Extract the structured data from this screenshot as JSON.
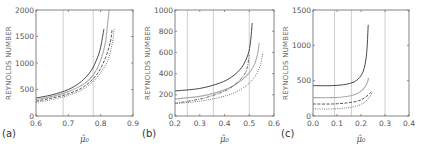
{
  "chart_data": [
    {
      "panel": "(a)",
      "type": "line",
      "xlabel": "μ̂₀",
      "ylabel": "REYNOLDS NUMBER",
      "xlim": [
        0.6,
        0.9
      ],
      "ylim": [
        0,
        2000
      ],
      "xticks": [
        "0.6",
        "0.7",
        "0.8",
        "0.9"
      ],
      "yticks": [
        "0",
        "500",
        "1000",
        "1500",
        "2000"
      ],
      "grid": false,
      "vlines": [
        0.684,
        0.777
      ],
      "series": [
        {
          "name": "solid",
          "style": "solid",
          "color": "#333333",
          "x": [
            0.6,
            0.65,
            0.7,
            0.74,
            0.77,
            0.79,
            0.8,
            0.81
          ],
          "y": [
            340,
            400,
            500,
            650,
            850,
            1100,
            1300,
            1640
          ]
        },
        {
          "name": "gray",
          "style": "solid",
          "color": "#aaaaaa",
          "x": [
            0.6,
            0.65,
            0.7,
            0.75,
            0.78,
            0.8,
            0.815,
            0.826
          ],
          "y": [
            310,
            370,
            460,
            610,
            800,
            1050,
            1400,
            2000
          ]
        },
        {
          "name": "dashed",
          "style": "dashed",
          "color": "#444444",
          "x": [
            0.6,
            0.65,
            0.7,
            0.75,
            0.79,
            0.815,
            0.83,
            0.835
          ],
          "y": [
            280,
            340,
            420,
            560,
            800,
            1100,
            1400,
            1620
          ]
        },
        {
          "name": "dotted",
          "style": "dotted",
          "color": "#666666",
          "x": [
            0.6,
            0.65,
            0.7,
            0.75,
            0.79,
            0.82,
            0.835,
            0.842
          ],
          "y": [
            255,
            310,
            390,
            520,
            740,
            1020,
            1350,
            1650
          ]
        }
      ]
    },
    {
      "panel": "(b)",
      "type": "line",
      "xlabel": "μ̂₀",
      "ylabel": "REYNOLDS NUMBER",
      "xlim": [
        0.2,
        0.6
      ],
      "ylim": [
        0,
        1000
      ],
      "xticks": [
        "0.2",
        "0.3",
        "0.4",
        "0.5",
        "0.6"
      ],
      "yticks": [
        "0",
        "200",
        "400",
        "600",
        "800",
        "1000"
      ],
      "grid": false,
      "vlines": [
        0.25,
        0.355,
        0.5
      ],
      "series": [
        {
          "name": "solid",
          "style": "solid",
          "color": "#333333",
          "x": [
            0.2,
            0.3,
            0.38,
            0.43,
            0.47,
            0.495,
            0.505,
            0.512
          ],
          "y": [
            236,
            260,
            310,
            370,
            460,
            580,
            700,
            877
          ]
        },
        {
          "name": "gray",
          "style": "solid",
          "color": "#aaaaaa",
          "x": [
            0.2,
            0.3,
            0.38,
            0.44,
            0.49,
            0.52,
            0.535,
            0.54
          ],
          "y": [
            160,
            185,
            230,
            290,
            380,
            480,
            600,
            690
          ]
        },
        {
          "name": "dash-dot",
          "style": "dashdot",
          "color": "#555555",
          "x": [
            0.2,
            0.3,
            0.38,
            0.43,
            0.47,
            0.49,
            0.5
          ],
          "y": [
            120,
            160,
            215,
            275,
            360,
            440,
            575
          ]
        },
        {
          "name": "dotted",
          "style": "dotted",
          "color": "#666666",
          "x": [
            0.2,
            0.3,
            0.38,
            0.44,
            0.49,
            0.525,
            0.545,
            0.555
          ],
          "y": [
            115,
            140,
            175,
            220,
            290,
            380,
            480,
            600
          ]
        }
      ]
    },
    {
      "panel": "(c)",
      "type": "line",
      "xlabel": "μ̂₀",
      "ylabel": "REYNOLDS NUMBER",
      "xlim": [
        0.0,
        0.4
      ],
      "ylim": [
        0,
        1500
      ],
      "xticks": [
        "0.0",
        "0.1",
        "0.2",
        "0.3",
        "0.4"
      ],
      "yticks": [
        "0",
        "500",
        "1000",
        "1500"
      ],
      "grid": false,
      "vlines": [
        0.09,
        0.16,
        0.3
      ],
      "series": [
        {
          "name": "solid",
          "style": "solid",
          "color": "#333333",
          "x": [
            0.0,
            0.08,
            0.14,
            0.18,
            0.205,
            0.218,
            0.225,
            0.23
          ],
          "y": [
            430,
            430,
            450,
            500,
            600,
            750,
            950,
            1290
          ]
        },
        {
          "name": "gray",
          "style": "solid",
          "color": "#aaaaaa",
          "x": [
            0.0,
            0.08,
            0.14,
            0.18,
            0.21,
            0.225,
            0.232
          ],
          "y": [
            260,
            260,
            275,
            310,
            380,
            460,
            540
          ]
        },
        {
          "name": "dashed",
          "style": "dashed",
          "color": "#444444",
          "x": [
            0.0,
            0.08,
            0.14,
            0.19,
            0.22,
            0.24,
            0.245
          ],
          "y": [
            170,
            170,
            185,
            215,
            270,
            330,
            360
          ]
        },
        {
          "name": "dotted",
          "style": "dotted",
          "color": "#666666",
          "x": [
            0.0,
            0.08,
            0.14,
            0.19,
            0.22,
            0.24,
            0.246
          ],
          "y": [
            100,
            100,
            115,
            150,
            210,
            290,
            330
          ]
        }
      ]
    }
  ],
  "panels": [
    {
      "label": "(a)",
      "box": [
        36,
        10,
        133,
        116
      ]
    },
    {
      "label": "(b)",
      "box": [
        175,
        10,
        274,
        116
      ]
    },
    {
      "label": "(c)",
      "box": [
        313,
        10,
        409,
        116
      ]
    }
  ]
}
